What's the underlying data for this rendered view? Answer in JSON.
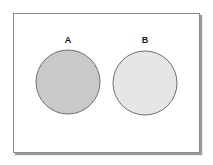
{
  "diagram": {
    "type": "venn",
    "frame": {
      "border_color": "#8a8a8a",
      "shadow_color": "#9a9a9a",
      "background": "#ffffff"
    },
    "sets": [
      {
        "label": "A",
        "fill": "#c9c9c9",
        "stroke": "#6e6e6e",
        "cx": 68,
        "cy": 82,
        "r": 32
      },
      {
        "label": "B",
        "fill": "#e6e6e6",
        "stroke": "#6e6e6e",
        "cx": 145,
        "cy": 83,
        "r": 32
      }
    ],
    "intersection": "none"
  }
}
